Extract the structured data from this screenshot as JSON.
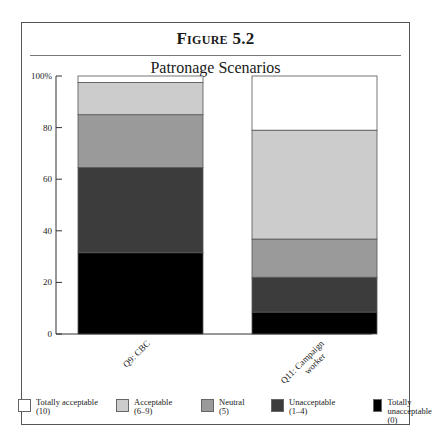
{
  "figure_label": "Figure 5.2",
  "chart_data": {
    "type": "bar",
    "stacked": true,
    "title": "Patronage Scenarios",
    "xlabel": "",
    "ylabel": "",
    "ylim": [
      0,
      100
    ],
    "yticks": [
      0,
      20,
      40,
      60,
      80,
      100
    ],
    "ytick_labels": [
      "0",
      "20",
      "40",
      "60",
      "80",
      "100%"
    ],
    "categories": [
      "Q9: CBC",
      "Q11: Campaign worker"
    ],
    "series": [
      {
        "name": "Totally unacceptable (0)",
        "label": "Totally unacceptable",
        "sub": "(0)",
        "color": "#000000",
        "values": [
          31.5,
          8.5
        ]
      },
      {
        "name": "Unacceptable (1–4)",
        "label": "Unacceptable",
        "sub": "(1–4)",
        "color": "#3c3c3c",
        "values": [
          33.0,
          13.5
        ]
      },
      {
        "name": "Neutral (5)",
        "label": "Neutral",
        "sub": "(5)",
        "color": "#9a9a9a",
        "values": [
          20.5,
          14.8
        ]
      },
      {
        "name": "Acceptable (6–9)",
        "label": "Acceptable",
        "sub": "(6–9)",
        "color": "#cccccc",
        "values": [
          12.5,
          42.2
        ]
      },
      {
        "name": "Totally acceptable (10)",
        "label": "Totally acceptable",
        "sub": "(10)",
        "color": "#ffffff",
        "values": [
          2.5,
          21.0
        ]
      }
    ],
    "legend_order": [
      4,
      3,
      2,
      1,
      0
    ],
    "legend_position": "bottom",
    "grid": false
  }
}
